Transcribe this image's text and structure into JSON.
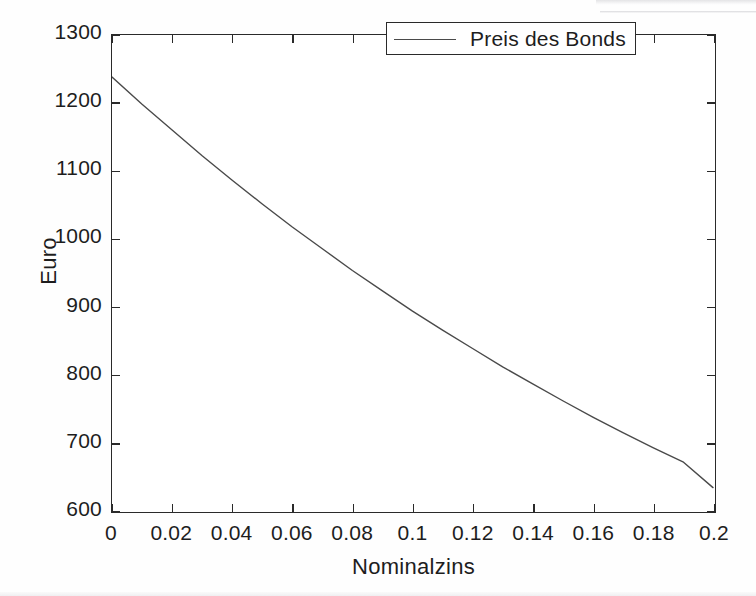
{
  "figure": {
    "background_color": "#fefefe",
    "axis_color": "#2a2a2a",
    "text_color": "#1d1d1d"
  },
  "axes": {
    "y_title": "Euro",
    "x_title": "Nominalzins",
    "y_ticks": [
      "600",
      "700",
      "800",
      "900",
      "1000",
      "1100",
      "1200",
      "1300"
    ],
    "x_ticks": [
      "0",
      "0.02",
      "0.04",
      "0.06",
      "0.08",
      "0.1",
      "0.12",
      "0.14",
      "0.16",
      "0.18",
      "0.2"
    ]
  },
  "legend": {
    "entries": [
      {
        "label": "Preis des Bonds",
        "color": "#4a4a4a",
        "marker": "line"
      }
    ]
  },
  "chart_data": {
    "type": "line",
    "title": "",
    "subtitle": "",
    "xlabel": "Nominalzins",
    "ylabel": "Euro",
    "xlim": [
      0,
      0.2
    ],
    "ylim": [
      600,
      1300
    ],
    "xticks": [
      0,
      0.02,
      0.04,
      0.06,
      0.08,
      0.1,
      0.12,
      0.14,
      0.16,
      0.18,
      0.2
    ],
    "yticks": [
      600,
      700,
      800,
      900,
      1000,
      1100,
      1200,
      1300
    ],
    "grid": false,
    "legend_position": "upper right",
    "series": [
      {
        "name": "Preis des Bonds",
        "color": "#4a4a4a",
        "line_width": 1.4,
        "x": [
          0,
          0.01,
          0.02,
          0.03,
          0.04,
          0.05,
          0.06,
          0.07,
          0.08,
          0.09,
          0.1,
          0.11,
          0.12,
          0.13,
          0.14,
          0.15,
          0.16,
          0.17,
          0.18,
          0.19,
          0.2
        ],
        "values": [
          1238,
          1198,
          1160,
          1122,
          1086,
          1051,
          1017,
          985,
          953,
          923,
          893,
          865,
          838,
          811,
          786,
          761,
          737,
          714,
          692,
          671,
          633
        ]
      }
    ],
    "annotations": []
  }
}
